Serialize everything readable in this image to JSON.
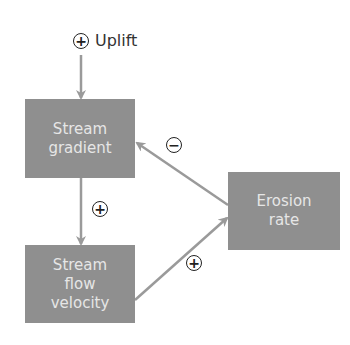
{
  "diagram": {
    "input": {
      "label": "Uplift",
      "sign": "+"
    },
    "nodes": {
      "stream_gradient": {
        "line1": "Stream",
        "line2": "gradient"
      },
      "stream_flow_velocity": {
        "line1": "Stream",
        "line2": "flow",
        "line3": "velocity"
      },
      "erosion_rate": {
        "line1": "Erosion",
        "line2": "rate"
      }
    },
    "edges": [
      {
        "from": "Uplift",
        "to": "Stream gradient",
        "sign": "+"
      },
      {
        "from": "Stream gradient",
        "to": "Stream flow velocity",
        "sign": "+"
      },
      {
        "from": "Stream flow velocity",
        "to": "Erosion rate",
        "sign": "+"
      },
      {
        "from": "Erosion rate",
        "to": "Stream gradient",
        "sign": "−"
      }
    ],
    "edge_signs": {
      "uplift": "+",
      "gradient_to_velocity": "+",
      "velocity_to_erosion": "+",
      "erosion_to_gradient": "−"
    },
    "colors": {
      "box": "#8f8f8f",
      "box_text": "#e6e6e6",
      "arrow": "#9a9a9a",
      "sign": "#222222"
    }
  }
}
